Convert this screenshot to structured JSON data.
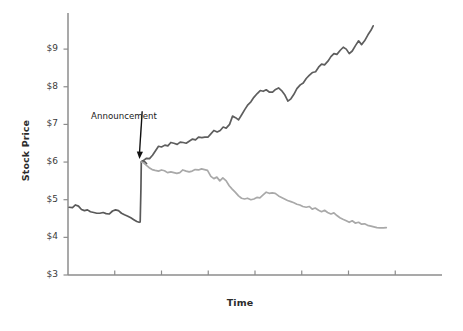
{
  "figure": {
    "background_color": "#ffffff",
    "plot_background_color": "#ffffff"
  },
  "chart_data": {
    "type": "line",
    "title": "",
    "xlabel": "Time",
    "ylabel": "Stock Price",
    "grid": false,
    "legend": false,
    "xlim": [
      0,
      100
    ],
    "ylim": [
      3,
      9.8
    ],
    "ytick_labels": [
      "$9",
      "$8",
      "$7",
      "$6",
      "$5",
      "$4",
      "$3"
    ],
    "ytick_values": [
      9,
      8,
      7,
      6,
      5,
      4,
      3
    ],
    "xtick_labels": [
      "",
      "",
      "",
      "",
      "",
      "",
      ""
    ],
    "xtick_count": 7,
    "annotations": [
      {
        "text": "Announcement",
        "target_x": 19.5,
        "target_y": 6.0,
        "label_x": 7.0,
        "label_y": 7.35,
        "arrow": true,
        "color": "#111111"
      }
    ],
    "series": [
      {
        "name": "pre-announcement",
        "color": "#595959",
        "width": 1.7,
        "points": [
          [
            0.3,
            4.8
          ],
          [
            1.2,
            4.79
          ],
          [
            2.0,
            4.86
          ],
          [
            2.8,
            4.83
          ],
          [
            3.6,
            4.74
          ],
          [
            4.4,
            4.71
          ],
          [
            5.2,
            4.73
          ],
          [
            6.0,
            4.68
          ],
          [
            6.9,
            4.66
          ],
          [
            7.7,
            4.64
          ],
          [
            8.5,
            4.64
          ],
          [
            9.4,
            4.66
          ],
          [
            10.2,
            4.63
          ],
          [
            11.0,
            4.62
          ],
          [
            11.9,
            4.7
          ],
          [
            12.7,
            4.73
          ],
          [
            13.5,
            4.71
          ],
          [
            14.3,
            4.64
          ],
          [
            15.1,
            4.6
          ],
          [
            16.0,
            4.56
          ],
          [
            16.8,
            4.52
          ],
          [
            17.6,
            4.47
          ],
          [
            18.4,
            4.42
          ],
          [
            19.0,
            4.4
          ],
          [
            19.3,
            4.41
          ],
          [
            19.5,
            5.3
          ],
          [
            19.6,
            6.0
          ],
          [
            19.9,
            6.03
          ],
          [
            20.4,
            6.02
          ],
          [
            21.0,
            5.96
          ]
        ]
      },
      {
        "name": "good-news-path",
        "color": "#5e5e5e",
        "width": 1.7,
        "points": [
          [
            19.6,
            6.0
          ],
          [
            20.3,
            6.05
          ],
          [
            21.0,
            6.1
          ],
          [
            21.8,
            6.09
          ],
          [
            22.6,
            6.18
          ],
          [
            23.4,
            6.3
          ],
          [
            24.2,
            6.42
          ],
          [
            25.0,
            6.4
          ],
          [
            25.9,
            6.45
          ],
          [
            26.7,
            6.43
          ],
          [
            27.5,
            6.52
          ],
          [
            28.3,
            6.5
          ],
          [
            29.2,
            6.47
          ],
          [
            30.0,
            6.53
          ],
          [
            30.8,
            6.52
          ],
          [
            31.6,
            6.5
          ],
          [
            32.5,
            6.56
          ],
          [
            33.3,
            6.61
          ],
          [
            34.1,
            6.59
          ],
          [
            34.9,
            6.66
          ],
          [
            35.8,
            6.65
          ],
          [
            36.6,
            6.66
          ],
          [
            37.4,
            6.66
          ],
          [
            38.2,
            6.75
          ],
          [
            39.0,
            6.84
          ],
          [
            39.9,
            6.8
          ],
          [
            40.7,
            6.84
          ],
          [
            41.5,
            6.93
          ],
          [
            42.3,
            6.9
          ],
          [
            43.2,
            7.0
          ],
          [
            44.0,
            7.22
          ],
          [
            44.8,
            7.18
          ],
          [
            45.6,
            7.12
          ],
          [
            46.4,
            7.25
          ],
          [
            47.3,
            7.4
          ],
          [
            48.1,
            7.52
          ],
          [
            48.9,
            7.6
          ],
          [
            49.7,
            7.72
          ],
          [
            50.6,
            7.82
          ],
          [
            51.4,
            7.9
          ],
          [
            52.2,
            7.88
          ],
          [
            53.0,
            7.92
          ],
          [
            53.8,
            7.86
          ],
          [
            54.7,
            7.86
          ],
          [
            55.5,
            7.93
          ],
          [
            56.3,
            7.97
          ],
          [
            57.1,
            7.9
          ],
          [
            58.0,
            7.78
          ],
          [
            58.8,
            7.62
          ],
          [
            59.6,
            7.68
          ],
          [
            60.4,
            7.8
          ],
          [
            61.2,
            7.95
          ],
          [
            62.1,
            8.05
          ],
          [
            62.9,
            8.1
          ],
          [
            63.7,
            8.22
          ],
          [
            64.5,
            8.3
          ],
          [
            65.4,
            8.38
          ],
          [
            66.2,
            8.4
          ],
          [
            67.0,
            8.52
          ],
          [
            67.8,
            8.6
          ],
          [
            68.6,
            8.58
          ],
          [
            69.5,
            8.68
          ],
          [
            70.3,
            8.8
          ],
          [
            71.1,
            8.88
          ],
          [
            71.9,
            8.86
          ],
          [
            72.8,
            8.97
          ],
          [
            73.6,
            9.05
          ],
          [
            74.4,
            9.0
          ],
          [
            75.2,
            8.88
          ],
          [
            76.0,
            8.95
          ],
          [
            76.9,
            9.1
          ],
          [
            77.7,
            9.22
          ],
          [
            78.5,
            9.12
          ],
          [
            79.3,
            9.22
          ],
          [
            80.2,
            9.38
          ],
          [
            81.0,
            9.5
          ],
          [
            81.6,
            9.62
          ]
        ]
      },
      {
        "name": "bad-news-path",
        "color": "#a9a9a9",
        "width": 1.7,
        "points": [
          [
            19.6,
            6.0
          ],
          [
            20.2,
            5.98
          ],
          [
            20.9,
            5.92
          ],
          [
            21.7,
            5.85
          ],
          [
            22.5,
            5.8
          ],
          [
            23.3,
            5.78
          ],
          [
            24.2,
            5.76
          ],
          [
            25.0,
            5.79
          ],
          [
            25.8,
            5.77
          ],
          [
            26.6,
            5.72
          ],
          [
            27.5,
            5.74
          ],
          [
            28.3,
            5.72
          ],
          [
            29.1,
            5.7
          ],
          [
            29.9,
            5.72
          ],
          [
            30.7,
            5.79
          ],
          [
            31.6,
            5.76
          ],
          [
            32.4,
            5.74
          ],
          [
            33.2,
            5.76
          ],
          [
            34.0,
            5.8
          ],
          [
            34.9,
            5.79
          ],
          [
            35.7,
            5.82
          ],
          [
            36.5,
            5.8
          ],
          [
            37.3,
            5.78
          ],
          [
            38.2,
            5.62
          ],
          [
            39.0,
            5.56
          ],
          [
            39.8,
            5.6
          ],
          [
            40.6,
            5.5
          ],
          [
            41.4,
            5.58
          ],
          [
            42.3,
            5.5
          ],
          [
            43.1,
            5.37
          ],
          [
            43.9,
            5.28
          ],
          [
            44.7,
            5.2
          ],
          [
            45.6,
            5.1
          ],
          [
            46.4,
            5.04
          ],
          [
            47.2,
            5.02
          ],
          [
            48.0,
            5.04
          ],
          [
            48.9,
            5.0
          ],
          [
            49.7,
            5.02
          ],
          [
            50.5,
            5.06
          ],
          [
            51.3,
            5.05
          ],
          [
            52.1,
            5.12
          ],
          [
            53.0,
            5.2
          ],
          [
            53.8,
            5.17
          ],
          [
            54.6,
            5.18
          ],
          [
            55.4,
            5.17
          ],
          [
            56.3,
            5.1
          ],
          [
            57.1,
            5.06
          ],
          [
            57.9,
            5.02
          ],
          [
            58.7,
            4.98
          ],
          [
            59.6,
            4.95
          ],
          [
            60.4,
            4.92
          ],
          [
            61.2,
            4.88
          ],
          [
            62.0,
            4.86
          ],
          [
            62.8,
            4.82
          ],
          [
            63.7,
            4.8
          ],
          [
            64.5,
            4.82
          ],
          [
            65.3,
            4.75
          ],
          [
            66.1,
            4.78
          ],
          [
            67.0,
            4.72
          ],
          [
            67.8,
            4.68
          ],
          [
            68.6,
            4.72
          ],
          [
            69.4,
            4.66
          ],
          [
            70.3,
            4.62
          ],
          [
            71.1,
            4.65
          ],
          [
            71.9,
            4.58
          ],
          [
            72.7,
            4.52
          ],
          [
            73.5,
            4.48
          ],
          [
            74.4,
            4.44
          ],
          [
            75.2,
            4.4
          ],
          [
            76.0,
            4.44
          ],
          [
            76.8,
            4.38
          ],
          [
            77.7,
            4.4
          ],
          [
            78.5,
            4.35
          ],
          [
            79.3,
            4.36
          ],
          [
            80.1,
            4.32
          ],
          [
            81.0,
            4.3
          ],
          [
            81.8,
            4.28
          ],
          [
            82.6,
            4.26
          ],
          [
            83.4,
            4.25
          ],
          [
            84.3,
            4.25
          ],
          [
            85.1,
            4.26
          ]
        ]
      }
    ]
  }
}
